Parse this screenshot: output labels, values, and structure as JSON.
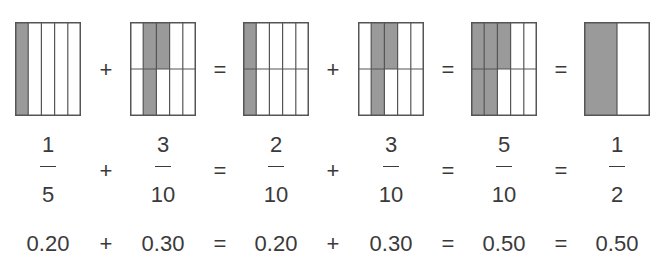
{
  "colors": {
    "shade": "#9a9a9a",
    "border": "#555555",
    "text": "#3a3a3a"
  },
  "boxes": [
    {
      "cols": 5,
      "rows": 1,
      "shaded": [
        [
          0,
          0
        ]
      ],
      "x": 15
    },
    {
      "cols": 5,
      "rows": 2,
      "shaded": [
        [
          1,
          0
        ],
        [
          1,
          1
        ],
        [
          2,
          0
        ]
      ],
      "x": 130
    },
    {
      "cols": 5,
      "rows": 2,
      "shaded": [
        [
          0,
          0
        ],
        [
          0,
          1
        ]
      ],
      "x": 243
    },
    {
      "cols": 5,
      "rows": 2,
      "shaded": [
        [
          1,
          0
        ],
        [
          1,
          1
        ],
        [
          2,
          0
        ]
      ],
      "x": 358
    },
    {
      "cols": 5,
      "rows": 2,
      "shaded": [
        [
          0,
          0
        ],
        [
          0,
          1
        ],
        [
          1,
          0
        ],
        [
          1,
          1
        ],
        [
          2,
          0
        ]
      ],
      "x": 471
    },
    {
      "cols": 2,
      "rows": 1,
      "shaded": [
        [
          0,
          0
        ]
      ],
      "x": 584
    }
  ],
  "operators": [
    "+",
    "=",
    "+",
    "=",
    "="
  ],
  "fractions": [
    {
      "numerator": "1",
      "denominator": "5"
    },
    {
      "numerator": "3",
      "denominator": "10"
    },
    {
      "numerator": "2",
      "denominator": "10"
    },
    {
      "numerator": "3",
      "denominator": "10"
    },
    {
      "numerator": "5",
      "denominator": "10"
    },
    {
      "numerator": "1",
      "denominator": "2"
    }
  ],
  "decimals": [
    "0.20",
    "0.30",
    "0.20",
    "0.30",
    "0.50",
    "0.50"
  ]
}
